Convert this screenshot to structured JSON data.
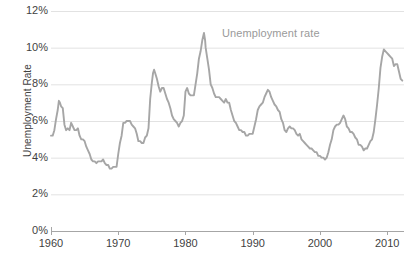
{
  "chart_data": {
    "type": "line",
    "title": "",
    "xlabel": "",
    "ylabel": "Unemployment Rate",
    "series_label": "Unemployment rate",
    "grid": true,
    "legend_position": "inline-annotation",
    "line_color": "#a6a6a6",
    "grid_color": "#e2e2e2",
    "axis_color": "#a6a6a6",
    "text_color": "#3f3f3f",
    "xlim": [
      1960,
      2012.5
    ],
    "ylim": [
      0,
      12
    ],
    "ytick_labels": [
      "0%",
      "2%",
      "4%",
      "6%",
      "8%",
      "10%",
      "12%"
    ],
    "ytick_values": [
      0,
      2,
      4,
      6,
      8,
      10,
      12
    ],
    "xtick_labels": [
      "1960",
      "1970",
      "1980",
      "1990",
      "2000",
      "2010"
    ],
    "xtick_values": [
      1960,
      1970,
      1980,
      1990,
      2000,
      2010
    ],
    "x": [
      1960.0,
      1960.25,
      1960.5,
      1960.75,
      1961.0,
      1961.17,
      1961.33,
      1961.5,
      1961.75,
      1962.0,
      1962.25,
      1962.5,
      1962.75,
      1963.0,
      1963.25,
      1963.5,
      1963.75,
      1964.0,
      1964.25,
      1964.5,
      1964.75,
      1965.0,
      1965.25,
      1965.5,
      1965.75,
      1966.0,
      1966.25,
      1966.5,
      1966.75,
      1967.0,
      1967.25,
      1967.5,
      1967.75,
      1968.0,
      1968.25,
      1968.5,
      1968.75,
      1969.0,
      1969.25,
      1969.5,
      1969.75,
      1970.0,
      1970.25,
      1970.5,
      1970.75,
      1971.0,
      1971.25,
      1971.5,
      1971.75,
      1972.0,
      1972.25,
      1972.5,
      1972.75,
      1973.0,
      1973.25,
      1973.5,
      1973.75,
      1974.0,
      1974.25,
      1974.5,
      1974.75,
      1975.0,
      1975.17,
      1975.33,
      1975.5,
      1975.75,
      1976.0,
      1976.25,
      1976.5,
      1976.75,
      1977.0,
      1977.25,
      1977.5,
      1977.75,
      1978.0,
      1978.25,
      1978.5,
      1978.75,
      1979.0,
      1979.25,
      1979.5,
      1979.75,
      1980.0,
      1980.25,
      1980.5,
      1980.75,
      1981.0,
      1981.25,
      1981.5,
      1981.75,
      1982.0,
      1982.25,
      1982.5,
      1982.75,
      1982.92,
      1983.0,
      1983.25,
      1983.5,
      1983.75,
      1984.0,
      1984.25,
      1984.5,
      1984.75,
      1985.0,
      1985.25,
      1985.5,
      1985.75,
      1986.0,
      1986.25,
      1986.5,
      1986.75,
      1987.0,
      1987.25,
      1987.5,
      1987.75,
      1988.0,
      1988.25,
      1988.5,
      1988.75,
      1989.0,
      1989.25,
      1989.5,
      1989.75,
      1990.0,
      1990.25,
      1990.5,
      1990.75,
      1991.0,
      1991.25,
      1991.5,
      1991.75,
      1992.0,
      1992.25,
      1992.5,
      1992.75,
      1993.0,
      1993.25,
      1993.5,
      1993.75,
      1994.0,
      1994.25,
      1994.5,
      1994.75,
      1995.0,
      1995.25,
      1995.5,
      1995.75,
      1996.0,
      1996.25,
      1996.5,
      1996.75,
      1997.0,
      1997.25,
      1997.5,
      1997.75,
      1998.0,
      1998.25,
      1998.5,
      1998.75,
      1999.0,
      1999.25,
      1999.5,
      1999.75,
      2000.0,
      2000.25,
      2000.5,
      2000.75,
      2001.0,
      2001.25,
      2001.5,
      2001.75,
      2002.0,
      2002.25,
      2002.5,
      2002.75,
      2003.0,
      2003.25,
      2003.5,
      2003.75,
      2004.0,
      2004.25,
      2004.5,
      2004.75,
      2005.0,
      2005.25,
      2005.5,
      2005.75,
      2006.0,
      2006.25,
      2006.5,
      2006.75,
      2007.0,
      2007.25,
      2007.5,
      2007.75,
      2008.0,
      2008.25,
      2008.5,
      2008.75,
      2009.0,
      2009.25,
      2009.5,
      2009.75,
      2010.0,
      2010.25,
      2010.5,
      2010.75,
      2011.0,
      2011.25,
      2011.5,
      2011.75,
      2012.0,
      2012.25
    ],
    "values": [
      5.2,
      5.2,
      5.5,
      6.1,
      6.6,
      7.1,
      7.0,
      6.8,
      6.7,
      5.8,
      5.5,
      5.6,
      5.5,
      5.9,
      5.7,
      5.5,
      5.5,
      5.6,
      5.2,
      5.0,
      5.0,
      4.9,
      4.6,
      4.4,
      4.2,
      3.9,
      3.8,
      3.8,
      3.7,
      3.8,
      3.8,
      3.8,
      3.9,
      3.7,
      3.6,
      3.6,
      3.4,
      3.4,
      3.5,
      3.5,
      3.5,
      4.2,
      4.8,
      5.2,
      5.9,
      5.9,
      6.0,
      6.0,
      6.0,
      5.8,
      5.7,
      5.6,
      5.3,
      4.9,
      4.9,
      4.8,
      4.8,
      5.1,
      5.2,
      5.6,
      7.2,
      8.1,
      8.6,
      8.8,
      8.6,
      8.3,
      7.9,
      7.6,
      7.8,
      7.8,
      7.5,
      7.2,
      7.0,
      6.7,
      6.3,
      6.1,
      6.0,
      5.9,
      5.7,
      5.9,
      6.0,
      6.3,
      7.6,
      7.8,
      7.5,
      7.4,
      7.4,
      7.4,
      8.0,
      8.6,
      9.4,
      9.8,
      10.4,
      10.8,
      10.4,
      10.0,
      9.4,
      8.8,
      8.0,
      7.8,
      7.5,
      7.3,
      7.3,
      7.3,
      7.2,
      7.1,
      7.0,
      7.2,
      7.0,
      7.0,
      6.6,
      6.3,
      6.0,
      5.9,
      5.7,
      5.5,
      5.5,
      5.4,
      5.4,
      5.2,
      5.2,
      5.3,
      5.3,
      5.3,
      5.7,
      6.1,
      6.6,
      6.8,
      6.9,
      7.0,
      7.3,
      7.5,
      7.7,
      7.6,
      7.3,
      7.1,
      6.9,
      6.8,
      6.6,
      6.5,
      6.1,
      5.9,
      5.5,
      5.4,
      5.6,
      5.7,
      5.6,
      5.6,
      5.5,
      5.3,
      5.2,
      5.3,
      5.0,
      4.9,
      4.8,
      4.7,
      4.6,
      4.5,
      4.5,
      4.4,
      4.3,
      4.3,
      4.1,
      4.1,
      4.0,
      4.0,
      3.9,
      4.0,
      4.3,
      4.7,
      5.0,
      5.5,
      5.7,
      5.8,
      5.8,
      5.9,
      6.1,
      6.3,
      6.1,
      5.7,
      5.6,
      5.4,
      5.4,
      5.3,
      5.1,
      5.0,
      4.7,
      4.7,
      4.6,
      4.4,
      4.5,
      4.5,
      4.7,
      4.9,
      5.0,
      5.4,
      6.1,
      6.9,
      7.8,
      8.9,
      9.5,
      9.9,
      9.8,
      9.7,
      9.6,
      9.5,
      9.4,
      9.0,
      9.1,
      9.1,
      8.7,
      8.3,
      8.2
    ]
  },
  "axes": {
    "y_axis_title": "Unemployment Rate"
  }
}
